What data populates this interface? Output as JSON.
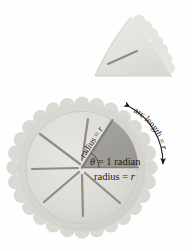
{
  "figure": {
    "background_color": "#fefefe"
  },
  "colors": {
    "crust": "#d8d6d0",
    "crust_edge": "#c2c0b9",
    "filling": "#dedcd6",
    "sector_shade": "#9e9c96",
    "cut_line": "#8c8a84",
    "text": "#1a1a1a",
    "arrow": "#1a1a1a",
    "wedge_fill": "#e4e2dc"
  },
  "wedge_piece": {
    "name": "pie-slice-piece",
    "description": "single cut pie slice shown above the whole pie"
  },
  "pie": {
    "name": "whole-pie",
    "description": "whole pie with scalloped crust and radial cut lines",
    "cut_lines_count": 7
  },
  "labels": {
    "theta": "θ = 1 radian",
    "theta_symbol": "θ",
    "theta_rest": " = 1 radian",
    "radius_horizontal_prefix": "radius = ",
    "radius_horizontal_var": "r",
    "radius_diagonal_prefix": "radius = ",
    "radius_diagonal_var": "r",
    "arc_length_prefix": "arc length = ",
    "arc_length_var": "r"
  },
  "geometry": {
    "pie_center_x": 82,
    "pie_center_y": 172,
    "pie_radius": 68,
    "sector_angle_degrees": 57.3,
    "sector_angle_radians": 1
  }
}
